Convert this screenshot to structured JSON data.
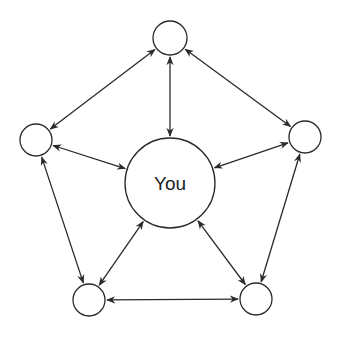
{
  "diagram": {
    "title": "",
    "center": {
      "id": "you",
      "label": "You",
      "cx": 170,
      "cy": 183,
      "r": 45
    },
    "nodes": [
      {
        "id": "top",
        "label": "",
        "cx": 170,
        "cy": 38,
        "r": 17
      },
      {
        "id": "left",
        "label": "",
        "cx": 36,
        "cy": 140,
        "r": 16
      },
      {
        "id": "right",
        "label": "",
        "cx": 305,
        "cy": 137,
        "r": 16
      },
      {
        "id": "bottom-left",
        "label": "",
        "cx": 89,
        "cy": 300,
        "r": 16
      },
      {
        "id": "bottom-right",
        "label": "",
        "cx": 256,
        "cy": 299,
        "r": 16
      }
    ],
    "edges": [
      {
        "from": "top",
        "to": "you",
        "direction": "both"
      },
      {
        "from": "left",
        "to": "you",
        "direction": "both"
      },
      {
        "from": "right",
        "to": "you",
        "direction": "both"
      },
      {
        "from": "bottom-left",
        "to": "you",
        "direction": "both"
      },
      {
        "from": "bottom-right",
        "to": "you",
        "direction": "both"
      },
      {
        "from": "top",
        "to": "left",
        "direction": "both"
      },
      {
        "from": "top",
        "to": "right",
        "direction": "both"
      },
      {
        "from": "left",
        "to": "bottom-left",
        "direction": "both"
      },
      {
        "from": "right",
        "to": "bottom-right",
        "direction": "both"
      },
      {
        "from": "bottom-left",
        "to": "bottom-right",
        "direction": "both"
      }
    ],
    "colors": {
      "stroke": "#2a2a2a",
      "background": "#ffffff"
    }
  }
}
